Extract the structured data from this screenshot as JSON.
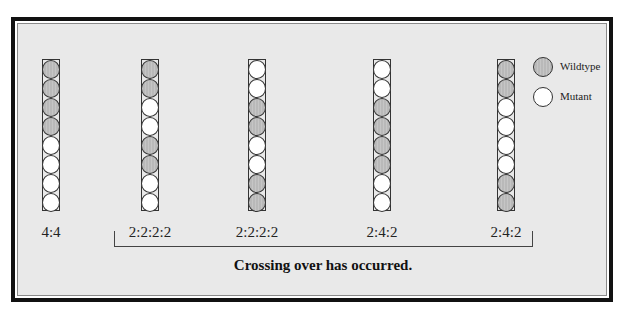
{
  "legend": {
    "wildtype": {
      "label": "Wildtype",
      "symbol": "shaded-circle",
      "color": "#b9b9b9"
    },
    "mutant": {
      "label": "Mutant",
      "symbol": "open-circle",
      "color": "#ffffff"
    }
  },
  "asci": [
    {
      "ratio": "4:4",
      "spores": [
        "W",
        "W",
        "W",
        "W",
        "M",
        "M",
        "M",
        "M"
      ]
    },
    {
      "ratio": "2:2:2:2",
      "spores": [
        "W",
        "W",
        "M",
        "M",
        "W",
        "W",
        "M",
        "M"
      ]
    },
    {
      "ratio": "2:2:2:2",
      "spores": [
        "M",
        "M",
        "W",
        "W",
        "M",
        "M",
        "W",
        "W"
      ]
    },
    {
      "ratio": "2:4:2",
      "spores": [
        "M",
        "M",
        "W",
        "W",
        "W",
        "W",
        "M",
        "M"
      ]
    },
    {
      "ratio": "2:4:2",
      "spores": [
        "W",
        "W",
        "M",
        "M",
        "M",
        "M",
        "W",
        "W"
      ]
    }
  ],
  "bracket": {
    "spans": "asci 2-5"
  },
  "caption": "Crossing over has occurred."
}
